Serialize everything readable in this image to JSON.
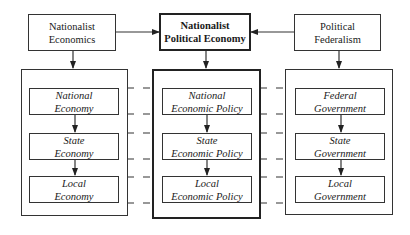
{
  "top_row": {
    "left": {
      "line1": "Nationalist",
      "line2": "Economics"
    },
    "center": {
      "line1": "Nationalist",
      "line2": "Political Economy"
    },
    "right": {
      "line1": "Political",
      "line2": "Federalism"
    }
  },
  "columns": {
    "economy": [
      {
        "line1": "National",
        "line2": "Economy"
      },
      {
        "line1": "State",
        "line2": "Economy"
      },
      {
        "line1": "Local",
        "line2": "Economy"
      }
    ],
    "policy": [
      {
        "line1": "National",
        "line2": "Economic Policy"
      },
      {
        "line1": "State",
        "line2": "Economic Policy"
      },
      {
        "line1": "Local",
        "line2": "Economic Policy"
      }
    ],
    "government": [
      {
        "line1": "Federal",
        "line2": "Government"
      },
      {
        "line1": "State",
        "line2": "Government"
      },
      {
        "line1": "Local",
        "line2": "Government"
      }
    ]
  },
  "colors": {
    "stroke": "#333333",
    "bold_stroke": "#222222",
    "background": "#ffffff"
  }
}
